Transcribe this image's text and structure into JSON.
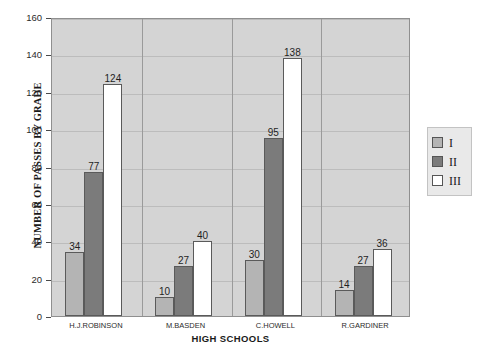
{
  "chart_data": {
    "type": "bar",
    "title": "",
    "xlabel": "HIGH SCHOOLS",
    "ylabel": "NUMBER OF PASSES BY GRADE",
    "categories": [
      "H.J.ROBINSON",
      "M.BASDEN",
      "C.HOWELL",
      "R.GARDINER"
    ],
    "series": [
      {
        "name": "I",
        "values": [
          34,
          10,
          30,
          14
        ],
        "color": "#b4b4b4"
      },
      {
        "name": "II",
        "values": [
          77,
          27,
          95,
          27
        ],
        "color": "#7b7b7b"
      },
      {
        "name": "III",
        "values": [
          124,
          40,
          138,
          36
        ],
        "color": "#ffffff"
      }
    ],
    "ylim": [
      0,
      160
    ],
    "ytick_step": 20,
    "yticks": [
      0,
      20,
      40,
      60,
      80,
      100,
      120,
      140,
      160
    ],
    "ytick_labels": [
      "0",
      "20",
      "40",
      "60",
      "80",
      "100",
      "120",
      "140",
      "160"
    ],
    "grid": true,
    "data_labels": true,
    "legend_position": "right",
    "plot_background": "#d4d4d4",
    "figure_background": "#ffffff"
  },
  "legend": {
    "entries": [
      {
        "label": "I"
      },
      {
        "label": "II"
      },
      {
        "label": "III"
      }
    ]
  }
}
